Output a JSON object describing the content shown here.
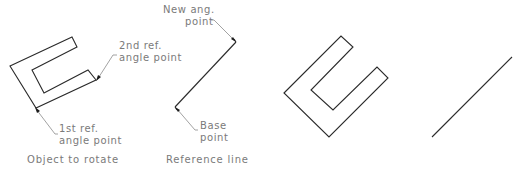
{
  "diagram": {
    "panels": [
      {
        "id": "object-to-rotate",
        "caption": "Object to rotate",
        "labels": {
          "second_ref_line1": "2nd ref.",
          "second_ref_line2": "angle point",
          "first_ref_line1": "1st ref.",
          "first_ref_line2": "angle point"
        }
      },
      {
        "id": "reference-line",
        "caption": "Reference line",
        "labels": {
          "new_ang_line1": "New ang.",
          "new_ang_line2": "point",
          "base_line1": "Base",
          "base_line2": "point"
        }
      },
      {
        "id": "rotated-object",
        "caption": ""
      },
      {
        "id": "rotated-reference-line",
        "caption": ""
      }
    ],
    "colors": {
      "stroke": "#2a2a2a",
      "leader": "#8a8a8a",
      "text": "#7a7a7a",
      "background": "#ffffff"
    }
  }
}
